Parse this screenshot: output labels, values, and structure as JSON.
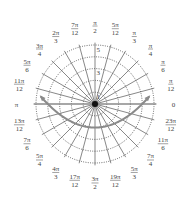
{
  "chart_data": {
    "type": "polar",
    "title": "",
    "grid": {
      "circles": [
        1,
        2,
        3,
        4,
        5
      ],
      "circle_style": "dotted",
      "ray_step": "π/12",
      "ray_style": "solid"
    },
    "radial_tick_labels": [
      "1",
      "3",
      "5"
    ],
    "rmax": 5,
    "angle_labels": [
      {
        "angle_deg": 0,
        "num": "0",
        "den": ""
      },
      {
        "angle_deg": 15,
        "num": "π",
        "den": "12"
      },
      {
        "angle_deg": 30,
        "num": "π",
        "den": "6"
      },
      {
        "angle_deg": 45,
        "num": "π",
        "den": "4"
      },
      {
        "angle_deg": 60,
        "num": "π",
        "den": "3"
      },
      {
        "angle_deg": 75,
        "num": "5π",
        "den": "12"
      },
      {
        "angle_deg": 90,
        "num": "π",
        "den": "2"
      },
      {
        "angle_deg": 105,
        "num": "7π",
        "den": "12"
      },
      {
        "angle_deg": 120,
        "num": "2π",
        "den": "3"
      },
      {
        "angle_deg": 135,
        "num": "3π",
        "den": "4"
      },
      {
        "angle_deg": 150,
        "num": "5π",
        "den": "6"
      },
      {
        "angle_deg": 165,
        "num": "11π",
        "den": "12"
      },
      {
        "angle_deg": 180,
        "num": "π",
        "den": ""
      },
      {
        "angle_deg": 195,
        "num": "13π",
        "den": "12"
      },
      {
        "angle_deg": 210,
        "num": "7π",
        "den": "6"
      },
      {
        "angle_deg": 225,
        "num": "5π",
        "den": "4"
      },
      {
        "angle_deg": 240,
        "num": "4π",
        "den": "3"
      },
      {
        "angle_deg": 255,
        "num": "17π",
        "den": "12"
      },
      {
        "angle_deg": 270,
        "num": "3π",
        "den": "2"
      },
      {
        "angle_deg": 285,
        "num": "19π",
        "den": "12"
      },
      {
        "angle_deg": 300,
        "num": "5π",
        "den": "3"
      },
      {
        "angle_deg": 315,
        "num": "7π",
        "den": "4"
      },
      {
        "angle_deg": 330,
        "num": "11π",
        "den": "6"
      },
      {
        "angle_deg": 345,
        "num": "23π",
        "den": "12"
      }
    ],
    "series": [
      {
        "name": "curve",
        "description": "U-shaped curve (parabola-like), minimum r≈2 at θ=3π/2, arrowheads at both ends near θ≈0.15 and θ≈π−0.15",
        "theta_deg": [
          8,
          0,
          -15,
          -30,
          -45,
          -60,
          -75,
          -90,
          -105,
          -120,
          -135,
          -150,
          -165,
          -180,
          -188
        ],
        "r": [
          4.5,
          4.0,
          3.18,
          2.67,
          2.34,
          2.14,
          2.03,
          2.0,
          2.03,
          2.14,
          2.34,
          2.67,
          3.18,
          4.0,
          4.5
        ],
        "color": "#8a8a8a",
        "arrows": "both"
      }
    ]
  }
}
